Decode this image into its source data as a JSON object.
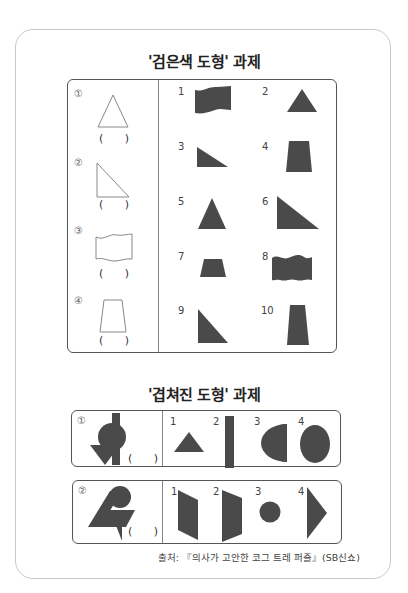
{
  "section1": {
    "title": "'검은색 도형' 과제",
    "left_items": [
      {
        "marker": "①",
        "shape": "outline-isoceles-triangle",
        "answer": "(  )"
      },
      {
        "marker": "②",
        "shape": "outline-right-triangle",
        "answer": "(  )"
      },
      {
        "marker": "③",
        "shape": "outline-wavy-rectangle",
        "answer": "(  )"
      },
      {
        "marker": "④",
        "shape": "outline-trapezoid",
        "answer": "(  )"
      }
    ],
    "right_items": [
      {
        "num": "1",
        "shape": "wavy-flag"
      },
      {
        "num": "2",
        "shape": "triangle"
      },
      {
        "num": "3",
        "shape": "right-triangle-flat"
      },
      {
        "num": "4",
        "shape": "trapezoid"
      },
      {
        "num": "5",
        "shape": "narrow-triangle"
      },
      {
        "num": "6",
        "shape": "right-triangle-large"
      },
      {
        "num": "7",
        "shape": "short-trapezoid"
      },
      {
        "num": "8",
        "shape": "wavy-rectangle"
      },
      {
        "num": "9",
        "shape": "right-triangle-tall"
      },
      {
        "num": "10",
        "shape": "tall-trapezoid"
      }
    ]
  },
  "section2": {
    "title": "'겹쳐진 도형' 과제",
    "rows": [
      {
        "marker": "①",
        "answer": "(  )",
        "options": [
          {
            "num": "1",
            "shape": "triangle"
          },
          {
            "num": "2",
            "shape": "bar"
          },
          {
            "num": "3",
            "shape": "half-circle"
          },
          {
            "num": "4",
            "shape": "ellipse"
          }
        ]
      },
      {
        "marker": "②",
        "answer": "(  )",
        "options": [
          {
            "num": "1",
            "shape": "parallelogram"
          },
          {
            "num": "2",
            "shape": "trapezoid-side"
          },
          {
            "num": "3",
            "shape": "circle"
          },
          {
            "num": "4",
            "shape": "arrow-triangle"
          }
        ]
      }
    ]
  },
  "source": "출처: 『의사가 고안한 코그 트레 퍼즐』(SB신쇼)",
  "colors": {
    "fill": "#4a4a4a",
    "outline": "#888888",
    "border": "#555555"
  }
}
